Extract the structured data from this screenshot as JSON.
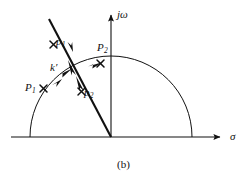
{
  "figure": {
    "caption": "(b)",
    "axes": {
      "vertical_label": "j",
      "vertical_label_sub": "ω",
      "horizontal_label": "σ"
    },
    "labels": {
      "p1_lower": "p",
      "p1_lower_sub": "1",
      "p2_lower": "p",
      "p2_lower_sub": "2",
      "P1_upper": "P",
      "P1_upper_sub": "1",
      "P2_upper": "P",
      "P2_upper_sub": "2",
      "gain": "k",
      "gain_prime": "′"
    },
    "colors": {
      "stroke": "#111111",
      "background": "#ffffff"
    },
    "geometry": {
      "origin": [
        111,
        137
      ],
      "semicircle_center": [
        111,
        137
      ],
      "semicircle_radius": 81,
      "real_axis_start": [
        11,
        137
      ],
      "real_axis_end": [
        222,
        137
      ],
      "imag_axis_top": [
        111,
        13
      ],
      "diagonal_start": [
        49,
        19
      ],
      "diagonal_end": [
        111,
        137
      ]
    }
  }
}
